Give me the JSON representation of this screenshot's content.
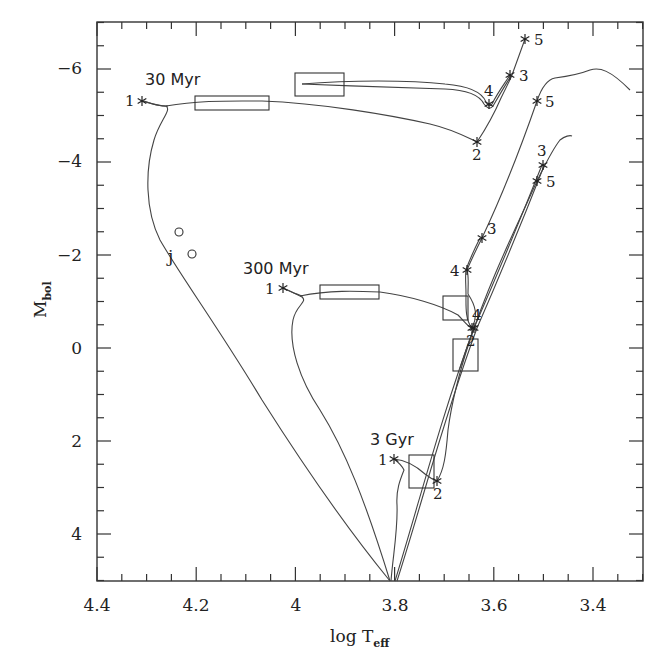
{
  "chart_data": {
    "type": "line",
    "title": "",
    "xlabel": "log T_eff",
    "ylabel": "M_bol",
    "xlabel_main": "log T",
    "xlabel_sub": "eff",
    "ylabel_main": "M",
    "ylabel_sub": "bol",
    "xlim": [
      4.4,
      3.3
    ],
    "ylim": [
      5,
      -7
    ],
    "x_inverted": true,
    "y_inverted": true,
    "grid": false,
    "legend": null,
    "x_ticks": [
      {
        "value": 4.4,
        "label": "4.4"
      },
      {
        "value": 4.2,
        "label": "4.2"
      },
      {
        "value": 4.0,
        "label": "4"
      },
      {
        "value": 3.8,
        "label": "3.8"
      },
      {
        "value": 3.6,
        "label": "3.6"
      },
      {
        "value": 3.4,
        "label": "3.4"
      }
    ],
    "y_ticks": [
      {
        "value": -6,
        "label": "−6"
      },
      {
        "value": -4,
        "label": "−4"
      },
      {
        "value": -2,
        "label": "−2"
      },
      {
        "value": 0,
        "label": "0"
      },
      {
        "value": 2,
        "label": "2"
      },
      {
        "value": 4,
        "label": "4"
      }
    ],
    "annotations": [
      {
        "text": "30 Myr",
        "x": 4.28,
        "y": -5.9
      },
      {
        "text": "300 Myr",
        "x": 4.09,
        "y": -1.6
      },
      {
        "text": "3 Gyr",
        "x": 3.76,
        "y": 2.2
      },
      {
        "text": "j",
        "x": 4.245,
        "y": -1.9
      }
    ],
    "series": [
      {
        "name": "30 Myr isochrone",
        "points": [
          [
            4.31,
            -5.3
          ],
          [
            4.28,
            -5.2
          ],
          [
            4.26,
            -5.15
          ],
          [
            4.24,
            -5.0
          ],
          [
            4.25,
            -4.5
          ],
          [
            4.26,
            -3.8
          ],
          [
            4.26,
            -3.2
          ],
          [
            4.24,
            -2.5
          ],
          [
            4.21,
            -2.0
          ],
          [
            4.1,
            -0.3
          ],
          [
            3.95,
            1.5
          ],
          [
            3.84,
            3.2
          ],
          [
            3.75,
            5.0
          ]
        ],
        "upper_branch": [
          [
            4.26,
            -5.15
          ],
          [
            4.2,
            -5.24
          ],
          [
            4.06,
            -5.26
          ],
          [
            3.9,
            -5.1
          ],
          [
            3.75,
            -4.85
          ],
          [
            3.66,
            -4.55
          ],
          [
            3.64,
            -4.4
          ],
          [
            3.61,
            -5.2
          ],
          [
            3.57,
            -5.8
          ],
          [
            3.53,
            -6.6
          ]
        ],
        "blue_loop": [
          [
            3.94,
            -5.65
          ],
          [
            3.8,
            -5.7
          ],
          [
            3.68,
            -5.55
          ],
          [
            3.63,
            -5.2
          ],
          [
            3.58,
            -5.8
          ]
        ],
        "markers": [
          {
            "label": "1",
            "x": 4.31,
            "y": -5.3
          },
          {
            "label": "2",
            "x": 3.64,
            "y": -4.4
          },
          {
            "label": "3",
            "x": 3.57,
            "y": -5.8
          },
          {
            "label": "4",
            "x": 3.62,
            "y": -5.25
          },
          {
            "label": "5",
            "x": 3.53,
            "y": -6.6
          }
        ],
        "boxes": [
          {
            "x0": 4.2,
            "x1": 4.05,
            "y0": -5.35,
            "y1": -5.05
          },
          {
            "x0": 3.99,
            "x1": 3.89,
            "y0": -5.85,
            "y1": -5.35
          }
        ]
      },
      {
        "name": "300 Myr isochrone",
        "points": [
          [
            4.02,
            -1.3
          ],
          [
            4.0,
            -1.2
          ],
          [
            3.97,
            -1.0
          ],
          [
            3.99,
            -0.8
          ],
          [
            4.0,
            0.0
          ],
          [
            3.98,
            1.0
          ],
          [
            3.92,
            1.8
          ],
          [
            3.84,
            2.6
          ],
          [
            3.78,
            3.4
          ],
          [
            3.75,
            5.0
          ]
        ],
        "giant_branch": [
          [
            4.0,
            -1.2
          ],
          [
            3.92,
            -1.2
          ],
          [
            3.83,
            -1.12
          ],
          [
            3.75,
            -0.7
          ],
          [
            3.7,
            -0.4
          ],
          [
            3.68,
            -0.8
          ],
          [
            3.66,
            -1.65
          ],
          [
            3.63,
            -2.35
          ],
          [
            3.58,
            -3.6
          ],
          [
            3.54,
            -4.6
          ],
          [
            3.52,
            -5.2
          ],
          [
            3.5,
            -5.5
          ],
          [
            3.45,
            -5.6
          ],
          [
            3.42,
            -5.8
          ],
          [
            3.33,
            -5.5
          ]
        ],
        "markers": [
          {
            "label": "1",
            "x": 4.02,
            "y": -1.3
          },
          {
            "label": "2",
            "x": 3.7,
            "y": -0.4
          },
          {
            "label": "3",
            "x": 3.63,
            "y": -2.35
          },
          {
            "label": "4",
            "x": 3.66,
            "y": -1.65
          },
          {
            "label": "5",
            "x": 3.52,
            "y": -5.25
          }
        ],
        "boxes": [
          {
            "x0": 3.92,
            "x1": 3.8,
            "y0": -1.35,
            "y1": -1.05
          },
          {
            "x0": 3.69,
            "x1": 3.64,
            "y0": -1.1,
            "y1": -0.6
          }
        ]
      },
      {
        "name": "3 Gyr isochrone",
        "points": [
          [
            3.79,
            2.4
          ],
          [
            3.78,
            2.6
          ],
          [
            3.79,
            3.0
          ],
          [
            3.78,
            3.6
          ],
          [
            3.76,
            4.4
          ],
          [
            3.75,
            5.0
          ]
        ],
        "giant_branch": [
          [
            3.79,
            2.4
          ],
          [
            3.76,
            2.45
          ],
          [
            3.73,
            2.7
          ],
          [
            3.71,
            2.85
          ],
          [
            3.69,
            2.4
          ],
          [
            3.67,
            1.0
          ],
          [
            3.64,
            -0.4
          ],
          [
            3.6,
            -2.0
          ],
          [
            3.55,
            -3.5
          ],
          [
            3.5,
            -4.0
          ],
          [
            3.47,
            -4.5
          ],
          [
            3.44,
            -4.6
          ]
        ],
        "markers": [
          {
            "label": "1",
            "x": 3.79,
            "y": 2.4
          },
          {
            "label": "2",
            "x": 3.71,
            "y": 2.85
          },
          {
            "label": "3",
            "x": 3.5,
            "y": -3.95
          },
          {
            "label": "4",
            "x": 3.64,
            "y": -0.4
          },
          {
            "label": "5",
            "x": 3.51,
            "y": -3.6
          }
        ],
        "boxes": [
          {
            "x0": 3.77,
            "x1": 3.72,
            "y0": 2.3,
            "y1": 3.0
          },
          {
            "x0": 3.67,
            "x1": 3.62,
            "y0": -0.2,
            "y1": 0.5
          }
        ]
      }
    ],
    "special_points": [
      {
        "label": "j",
        "marker": "circle",
        "x": 4.23,
        "y": -2.5
      },
      {
        "label": "j",
        "marker": "circle",
        "x": 4.21,
        "y": -2.0
      }
    ]
  }
}
